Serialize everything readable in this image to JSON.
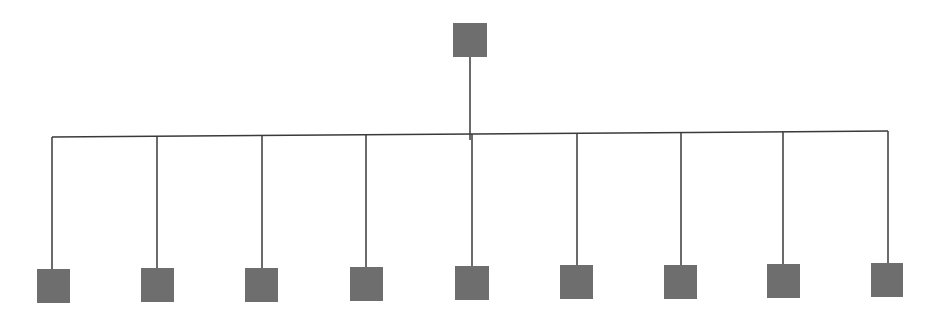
{
  "diagram": {
    "type": "tree",
    "colors": {
      "node_fill": "#6e6e6e",
      "edge": "#3a3a3a",
      "background": "#ffffff"
    },
    "root": {
      "x": 453,
      "y": 23,
      "w": 34,
      "h": 34,
      "cx": 470
    },
    "bus": {
      "x1": 52,
      "y1": 137,
      "x2": 888,
      "y2": 131
    },
    "children": [
      {
        "x": 37,
        "y": 269,
        "w": 33,
        "h": 34,
        "cx": 52
      },
      {
        "x": 141,
        "y": 268,
        "w": 33,
        "h": 34,
        "cx": 157
      },
      {
        "x": 245,
        "y": 268,
        "w": 33,
        "h": 34,
        "cx": 262
      },
      {
        "x": 350,
        "y": 267,
        "w": 33,
        "h": 34,
        "cx": 366
      },
      {
        "x": 455,
        "y": 266,
        "w": 34,
        "h": 34,
        "cx": 472
      },
      {
        "x": 560,
        "y": 265,
        "w": 33,
        "h": 34,
        "cx": 577
      },
      {
        "x": 664,
        "y": 265,
        "w": 33,
        "h": 34,
        "cx": 681
      },
      {
        "x": 767,
        "y": 264,
        "w": 33,
        "h": 34,
        "cx": 783
      },
      {
        "x": 871,
        "y": 263,
        "w": 32,
        "h": 34,
        "cx": 888
      }
    ]
  }
}
